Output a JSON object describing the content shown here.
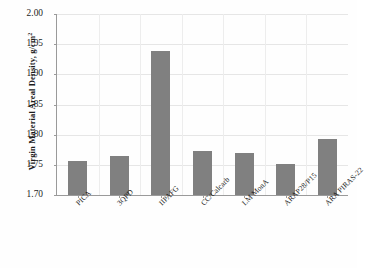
{
  "chart_data": {
    "type": "bar",
    "title": "",
    "xlabel": "",
    "ylabel": "Virgin Material Areal Density, g/cm2",
    "ylabel_main": "Virgin Material Areal Density, g/cm",
    "ylabel_sup": "2",
    "categories": [
      "PICA",
      "3QPD",
      "IIPAFG",
      "CC/Calcarb",
      "LM MonA",
      "ARAP28/P15",
      "ARA PIRAS-22"
    ],
    "values": [
      1.757,
      1.765,
      1.938,
      1.773,
      1.77,
      1.752,
      1.793
    ],
    "ylim": [
      1.7,
      2.0
    ],
    "ytick_step": 0.05,
    "yticks": [
      2.0,
      1.95,
      1.9,
      1.85,
      1.8,
      1.75,
      1.7
    ],
    "ytick_labels": [
      "2.00",
      "1.95",
      "1.90",
      "1.85",
      "1.80",
      "1.75",
      "1.70"
    ],
    "grid": true,
    "legend": "none",
    "bar_color": "#808080",
    "axis_color": "#9a9a9a",
    "grid_color": "#e6e6e6",
    "background": "#fefefe",
    "text_color": "#1c1c1c"
  }
}
